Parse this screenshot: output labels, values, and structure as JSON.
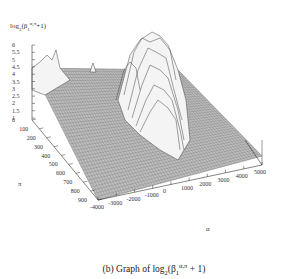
{
  "figure": {
    "caption_prefix": "(b) Graph of log",
    "caption_sub": "2",
    "caption_mid": "(β",
    "caption_sub2": "1",
    "caption_sup": "α,π",
    "caption_suffix": " + 1)"
  },
  "chart_data": {
    "type": "surface3d",
    "title": "",
    "zlabel": {
      "prefix": "log",
      "sub": "2",
      "mid": "(β",
      "sub2": "1",
      "sup": "α,π",
      "suffix": "+1)"
    },
    "xlabel": "α",
    "ylabel": "π",
    "x_ticks": [
      "-4000",
      "-3000",
      "-2000",
      "-1000",
      "0",
      "1000",
      "2000",
      "3000",
      "4000",
      "5000"
    ],
    "y_ticks": [
      "0",
      "100",
      "200",
      "300",
      "400",
      "500",
      "600",
      "700",
      "800",
      "900"
    ],
    "z_ticks": [
      "1",
      "1.5",
      "2",
      "2.5",
      "3",
      "3.5",
      "4",
      "4.5",
      "5",
      "5.5",
      "6"
    ],
    "xlim": [
      -4000,
      5000
    ],
    "ylim": [
      0,
      900
    ],
    "zlim": [
      1,
      6
    ],
    "render": "wireframe hidden-line, grey mesh",
    "features": [
      {
        "description": "baseline plane near z=1 across all α, π"
      },
      {
        "description": "main ridge of peaks near α≈0..1000, across π≈0..600, max z≈6"
      },
      {
        "description": "small peaks near α≈-4000, π≈0..200, z≈2..2.5"
      },
      {
        "description": "small peak near α≈-1500, π≈0, z≈1.7"
      }
    ]
  }
}
